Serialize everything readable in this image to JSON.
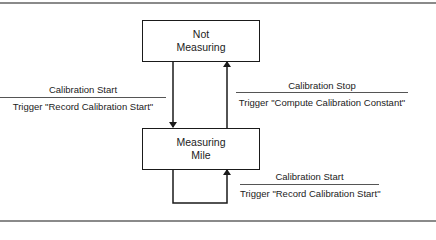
{
  "diagram": {
    "type": "state-transition",
    "states": [
      {
        "id": "not_measuring",
        "lines": [
          "Not",
          "Measuring"
        ]
      },
      {
        "id": "measuring_mile",
        "lines": [
          "Measuring",
          "Mile"
        ]
      }
    ],
    "transitions": [
      {
        "from": "not_measuring",
        "to": "measuring_mile",
        "event": "Calibration Start",
        "action": "Trigger \"Record Calibration Start\""
      },
      {
        "from": "measuring_mile",
        "to": "not_measuring",
        "event": "Calibration Stop",
        "action": "Trigger \"Compute Calibration Constant\""
      },
      {
        "from": "measuring_mile",
        "to": "measuring_mile",
        "event": "Calibration Start",
        "action": "Trigger \"Record Calibration Start\""
      }
    ]
  }
}
